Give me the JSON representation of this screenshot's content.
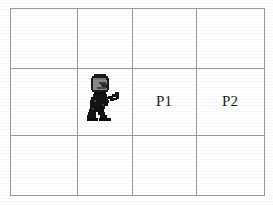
{
  "scene": {
    "type": "gridworld",
    "background_color": "#ffffff",
    "grid_line_color": "#9a9a9a",
    "text_color": "#1c1c1c"
  },
  "grid": {
    "columns": 4,
    "rows": 3,
    "x_lines": [
      10,
      77,
      132,
      196,
      265
    ],
    "y_lines": [
      8,
      68,
      135,
      196
    ],
    "cells": [
      {
        "row": 0,
        "col": 0,
        "label": "",
        "content": "empty"
      },
      {
        "row": 0,
        "col": 1,
        "label": "",
        "content": "empty"
      },
      {
        "row": 0,
        "col": 2,
        "label": "",
        "content": "empty"
      },
      {
        "row": 0,
        "col": 3,
        "label": "",
        "content": "empty"
      },
      {
        "row": 1,
        "col": 0,
        "label": "",
        "content": "empty"
      },
      {
        "row": 1,
        "col": 1,
        "label": "",
        "content": "agent"
      },
      {
        "row": 1,
        "col": 2,
        "label": "P1",
        "content": "label"
      },
      {
        "row": 1,
        "col": 3,
        "label": "P2",
        "content": "label"
      },
      {
        "row": 2,
        "col": 0,
        "label": "",
        "content": "empty"
      },
      {
        "row": 2,
        "col": 1,
        "label": "",
        "content": "empty"
      },
      {
        "row": 2,
        "col": 2,
        "label": "",
        "content": "empty"
      },
      {
        "row": 2,
        "col": 3,
        "label": "",
        "content": "empty"
      }
    ]
  },
  "agent": {
    "name": "robot-sprite",
    "cell_row": 1,
    "cell_col": 1,
    "facing": "right",
    "body_color": "#1a1a1a",
    "helmet_color": "#6e6e6e",
    "visor_color": "#3a3a3a",
    "outline_color": "#000000"
  },
  "labels": {
    "p1": "P1",
    "p2": "P2"
  }
}
